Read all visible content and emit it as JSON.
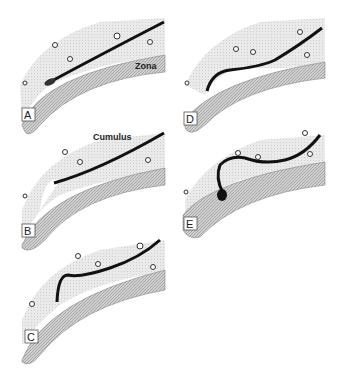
{
  "figure": {
    "panels": [
      {
        "id": "A",
        "label": "A"
      },
      {
        "id": "B",
        "label": "B"
      },
      {
        "id": "C",
        "label": "C"
      },
      {
        "id": "D",
        "label": "D"
      },
      {
        "id": "E",
        "label": "E"
      }
    ],
    "annotations": {
      "zona": "Zona",
      "cumulus": "Cumulus"
    },
    "colors": {
      "cumulus_fill": "#e4e4e4",
      "zona_fill": "#c8c8c8",
      "sperm_path": "#111111",
      "background": "#ffffff"
    }
  }
}
